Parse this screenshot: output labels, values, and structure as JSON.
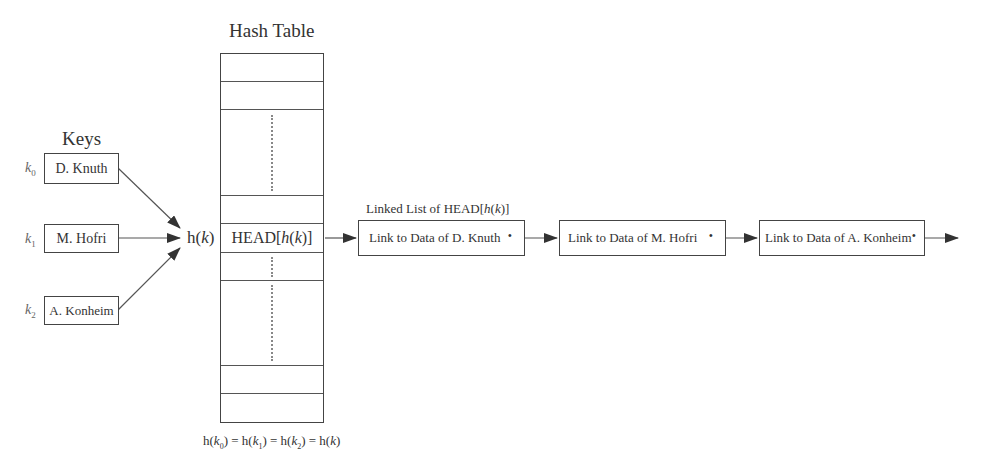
{
  "diagram": {
    "hash_table_title": "Hash Table",
    "keys_title": "Keys",
    "keys": [
      {
        "var": "k",
        "sub": "0",
        "name": "D. Knuth"
      },
      {
        "var": "k",
        "sub": "1",
        "name": "M. Hofri"
      },
      {
        "var": "k",
        "sub": "2",
        "name": "A. Konheim"
      }
    ],
    "hash_function": {
      "name": "h",
      "arg": "k"
    },
    "head_cell": {
      "prefix": "HEAD[",
      "fn": "h",
      "arg": "k",
      "suffix": "]"
    },
    "linked_list_title": {
      "prefix": "Linked List of HEAD[",
      "fn": "h",
      "arg": "k",
      "suffix": "]"
    },
    "list_nodes": [
      {
        "label": "Link to Data of D. Knuth"
      },
      {
        "label": "Link to Data of M. Hofri"
      },
      {
        "label": "Link to Data of A. Konheim"
      }
    ],
    "pointer_glyph": "•",
    "footnote": "h(k0) = h(k1) = h(k2) = h(k)",
    "colors": {
      "line": "#444444",
      "text": "#333333",
      "background": "#ffffff"
    }
  }
}
